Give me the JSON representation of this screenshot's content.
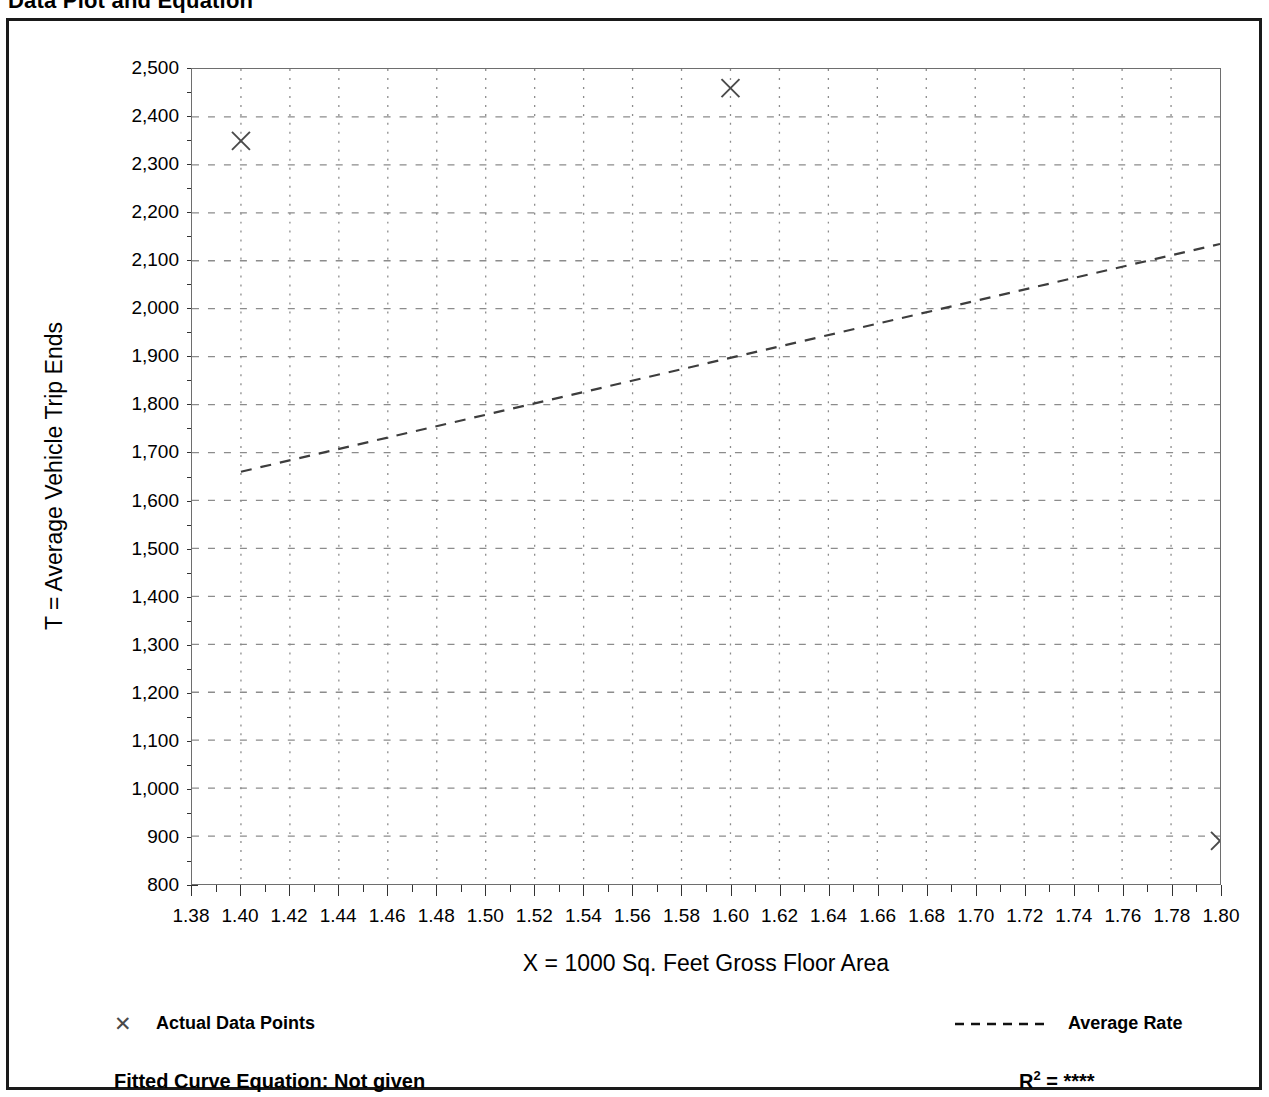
{
  "page_title": "Data Plot and Equation",
  "axes": {
    "y_title": "T = Average Vehicle Trip Ends",
    "x_title": "X = 1000 Sq. Feet Gross Floor Area"
  },
  "legend": {
    "data_points_marker": "✕",
    "data_points_label": "Actual Data Points",
    "average_rate_label": "Average Rate"
  },
  "footer": {
    "equation_label": "Fitted Curve Equation:  Not given",
    "r2_symbol": "R",
    "r2_exponent": "2",
    "r2_equals": " = ",
    "r2_value": "****"
  },
  "chart_data": {
    "type": "scatter",
    "title": "Data Plot and Equation",
    "xlabel": "X = 1000 Sq. Feet Gross Floor Area",
    "ylabel": "T = Average Vehicle Trip Ends",
    "xlim": [
      1.38,
      1.8
    ],
    "ylim": [
      800,
      2500
    ],
    "x_ticks": [
      "1.38",
      "1.40",
      "1.42",
      "1.44",
      "1.46",
      "1.48",
      "1.50",
      "1.52",
      "1.54",
      "1.56",
      "1.58",
      "1.60",
      "1.62",
      "1.64",
      "1.66",
      "1.68",
      "1.70",
      "1.72",
      "1.74",
      "1.76",
      "1.78",
      "1.80"
    ],
    "x_tick_values": [
      1.38,
      1.4,
      1.42,
      1.44,
      1.46,
      1.48,
      1.5,
      1.52,
      1.54,
      1.56,
      1.58,
      1.6,
      1.62,
      1.64,
      1.66,
      1.68,
      1.7,
      1.72,
      1.74,
      1.76,
      1.78,
      1.8
    ],
    "x_minor_step": 0.01,
    "y_ticks": [
      "800",
      "900",
      "1,000",
      "1,100",
      "1,200",
      "1,300",
      "1,400",
      "1,500",
      "1,600",
      "1,700",
      "1,800",
      "1,900",
      "2,000",
      "2,100",
      "2,200",
      "2,300",
      "2,400",
      "2,500"
    ],
    "y_tick_values": [
      800,
      900,
      1000,
      1100,
      1200,
      1300,
      1400,
      1500,
      1600,
      1700,
      1800,
      1900,
      2000,
      2100,
      2200,
      2300,
      2400,
      2500
    ],
    "y_minor_step": 50,
    "grid": true,
    "grid_style": "dotted",
    "legend_position": "below-axes",
    "series": [
      {
        "name": "Actual Data Points",
        "type": "scatter",
        "marker": "x",
        "points": [
          {
            "x": 1.4,
            "y": 2350
          },
          {
            "x": 1.6,
            "y": 2460
          },
          {
            "x": 1.8,
            "y": 890
          }
        ]
      },
      {
        "name": "Average Rate",
        "type": "line",
        "style": "dashed",
        "points": [
          {
            "x": 1.4,
            "y": 1660
          },
          {
            "x": 1.8,
            "y": 2135
          }
        ]
      }
    ]
  }
}
